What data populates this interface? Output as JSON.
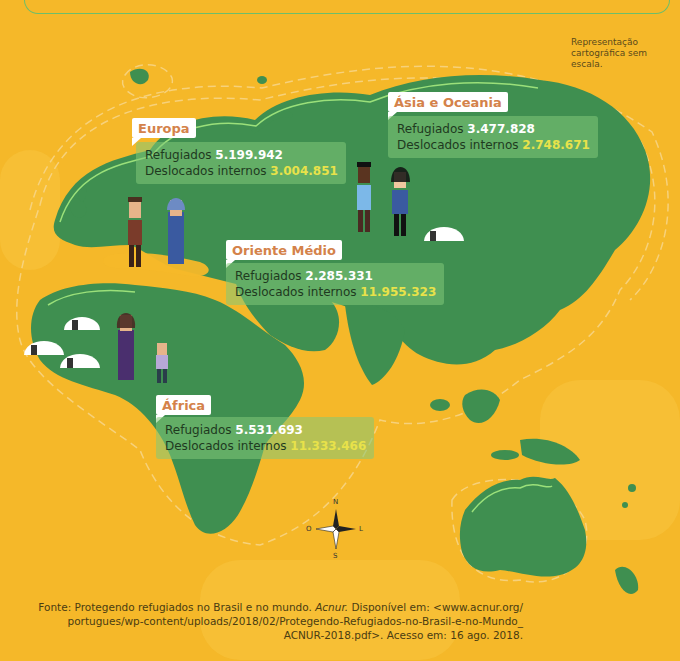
{
  "map": {
    "title_note": "Representação cartográfica sem escala.",
    "colors": {
      "ocean": "#F5B829",
      "land": "#3F8F50",
      "coast_line": "#9BE07A",
      "label": "#D4824A",
      "refugiados_value": "#FFFFFF",
      "deslocados_value": "#E8E24A"
    },
    "regions": [
      {
        "name": "Europa",
        "refugiados_label": "Refugiados",
        "refugiados": "5.199.942",
        "deslocados_label": "Deslocados internos",
        "deslocados": "3.004.851"
      },
      {
        "name": "Ásia e Oceania",
        "refugiados_label": "Refugiados",
        "refugiados": "3.477.828",
        "deslocados_label": "Deslocados internos",
        "deslocados": "2.748.671"
      },
      {
        "name": "Oriente Médio",
        "refugiados_label": "Refugiados",
        "refugiados": "2.285.331",
        "deslocados_label": "Deslocados internos",
        "deslocados": "11.955.323"
      },
      {
        "name": "África",
        "refugiados_label": "Refugiados",
        "refugiados": "5.531.693",
        "deslocados_label": "Deslocados internos",
        "deslocados": "11.333.466"
      }
    ],
    "compass": {
      "n": "N",
      "s": "S",
      "l": "L",
      "o": "O"
    },
    "source": {
      "prefix": "Fonte: Protegendo refugiados no Brasil e no mundo. ",
      "publisher": "Acnur.",
      "line1_rest": " Disponível em: <www.acnur.org/",
      "line2": "portugues/wp-content/uploads/2018/02/Protegendo-Refugiados-no-Brasil-e-no-Mundo_",
      "line3": "ACNUR-2018.pdf>. Acesso em: 16 ago. 2018."
    }
  }
}
